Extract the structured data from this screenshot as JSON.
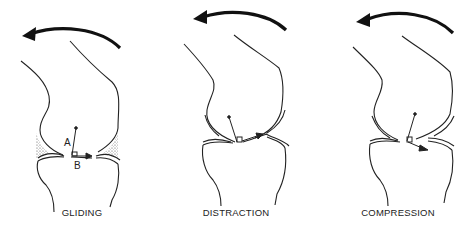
{
  "figures": [
    {
      "id": "gliding",
      "caption": "GLIDING",
      "vector_labels": {
        "a": "A",
        "b": "B"
      }
    },
    {
      "id": "distraction",
      "caption": "DISTRACTION"
    },
    {
      "id": "compression",
      "caption": "COMPRESSION"
    }
  ],
  "colors": {
    "line": "#222222",
    "background": "#ffffff",
    "stipple": "#555555"
  }
}
